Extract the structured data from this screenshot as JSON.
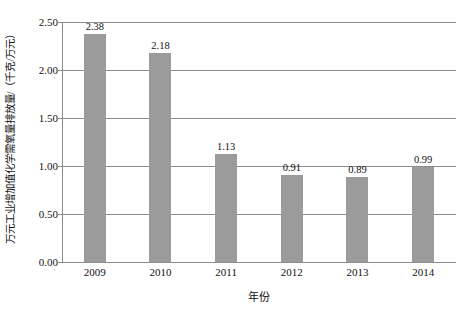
{
  "chart_data": {
    "type": "bar",
    "title": "",
    "categories": [
      "2009",
      "2010",
      "2011",
      "2012",
      "2013",
      "2014"
    ],
    "values": [
      2.38,
      2.18,
      1.13,
      0.91,
      0.89,
      0.99
    ],
    "value_labels": [
      "2.38",
      "2.18",
      "1.13",
      "0.91",
      "0.89",
      "0.99"
    ],
    "xlabel": "年份",
    "ylabel": "万元工业增加值化学需氧量排放量/（千克/万元）",
    "ylim": [
      0.0,
      2.5
    ],
    "yticks": [
      0.0,
      0.5,
      1.0,
      1.5,
      2.0,
      2.5
    ],
    "ytick_labels": [
      "0.00",
      "0.50",
      "1.00",
      "1.50",
      "2.00",
      "2.50"
    ],
    "grid": true,
    "legend": null,
    "series": [
      {
        "name": "万元工业增加值化学需氧量排放量",
        "values": [
          2.38,
          2.18,
          1.13,
          0.91,
          0.89,
          0.99
        ]
      }
    ],
    "colors": {
      "bar_fill": "#9b9b9b",
      "gridline": "#8d8d8d",
      "axis_line": "#8a8a8a",
      "text": "#111111",
      "background": "#ffffff"
    }
  }
}
